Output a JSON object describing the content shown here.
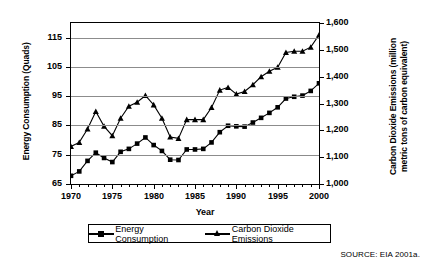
{
  "chart_data": {
    "type": "line",
    "title": "",
    "xlabel": "Year",
    "ylabel": "Energy Consumption (Quads)",
    "y2label": "Carbon Dioxide Emissions (million metric tons of carbon equivalent)",
    "xlim": [
      1970,
      2000
    ],
    "ylim": [
      65,
      120
    ],
    "y2lim": [
      1000,
      1600
    ],
    "grid": true,
    "legend_position": "bottom",
    "x": [
      1970,
      1971,
      1972,
      1973,
      1974,
      1975,
      1976,
      1977,
      1978,
      1979,
      1980,
      1981,
      1982,
      1983,
      1984,
      1985,
      1986,
      1987,
      1988,
      1989,
      1990,
      1991,
      1992,
      1993,
      1994,
      1995,
      1996,
      1997,
      1998,
      1999,
      2000
    ],
    "xtick_labels": [
      "1970",
      "1975",
      "1980",
      "1985",
      "1990",
      "1995",
      "2000"
    ],
    "xticks": [
      1970,
      1975,
      1980,
      1985,
      1990,
      1995,
      2000
    ],
    "ytick_labels": [
      "65",
      "75",
      "85",
      "95",
      "105",
      "115"
    ],
    "yticks": [
      65,
      75,
      85,
      95,
      105,
      115
    ],
    "y2tick_labels": [
      "1,000",
      "1,100",
      "1,200",
      "1,300",
      "1,400",
      "1,500",
      "1,600"
    ],
    "y2ticks": [
      1000,
      1100,
      1200,
      1300,
      1400,
      1500,
      1600
    ],
    "series": [
      {
        "name": "Energy Consumption",
        "axis": "left",
        "marker": "square",
        "units": "Quads",
        "values": [
          67.8,
          69.3,
          72.9,
          75.7,
          73.9,
          72.5,
          76.0,
          77.0,
          78.8,
          80.9,
          78.3,
          76.3,
          73.3,
          73.2,
          76.8,
          76.8,
          77.0,
          79.2,
          82.7,
          84.9,
          84.7,
          84.6,
          86.0,
          87.6,
          89.3,
          91.2,
          94.2,
          94.8,
          95.2,
          96.8,
          99.4
        ]
      },
      {
        "name": "Carbon Dioxide Emissions",
        "axis": "right",
        "marker": "triangle",
        "units": "million metric tons of carbon equivalent",
        "values": [
          1140,
          1155,
          1205,
          1270,
          1215,
          1180,
          1245,
          1290,
          1305,
          1330,
          1295,
          1245,
          1175,
          1170,
          1240,
          1240,
          1240,
          1285,
          1350,
          1360,
          1335,
          1345,
          1370,
          1400,
          1420,
          1435,
          1490,
          1495,
          1495,
          1510,
          1555
        ]
      }
    ]
  },
  "axes": {
    "x_title": "Year",
    "y_left_title": "Energy Consumption (Quads)",
    "y_right_title": "Carbon Dioxide Emissions (million metric tons of carbon equivalent)"
  },
  "legend": {
    "items": [
      {
        "label": "Energy Consumption",
        "marker": "square-marker"
      },
      {
        "label": "Carbon Dioxide Emissions",
        "marker": "triangle-marker"
      }
    ]
  },
  "source": {
    "note": "SOURCE: EIA 2001a."
  },
  "colors": {
    "line": "#000000",
    "grid": "#8c8c8c",
    "frame": "#000000",
    "background": "#ffffff"
  }
}
